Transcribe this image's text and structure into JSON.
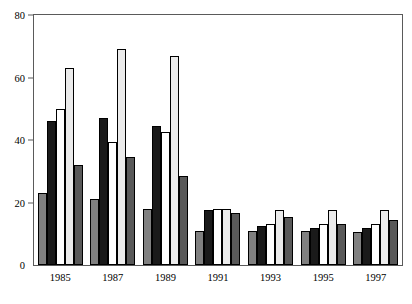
{
  "chart_data": {
    "type": "bar",
    "title": "",
    "subtitle": "",
    "xlabel": "",
    "ylabel": "",
    "categories": [
      "1985",
      "1987",
      "1989",
      "1991",
      "1993",
      "1995",
      "1997"
    ],
    "series": [
      {
        "name": "Bolivia",
        "color": "#808080",
        "values": [
          23,
          21,
          18,
          11,
          11,
          11,
          10.5
        ]
      },
      {
        "name": "Colombia",
        "color": "#1a1a1a",
        "values": [
          46,
          47,
          44.5,
          17.5,
          12.5,
          12,
          12
        ]
      },
      {
        "name": "Ecuador",
        "color": "#ffffff",
        "values": [
          50,
          39.5,
          42.5,
          18,
          13,
          13,
          13
        ]
      },
      {
        "name": "Peru",
        "color": "#ebebeb",
        "values": [
          63,
          69,
          67,
          18,
          17.5,
          17.5,
          17.5
        ]
      },
      {
        "name": "Venezuela",
        "color": "#595959",
        "values": [
          32,
          34.5,
          28.5,
          16.5,
          15.5,
          13,
          14.5
        ]
      }
    ],
    "ylim": [
      0,
      80
    ],
    "yticks": [
      0,
      20,
      40,
      60,
      80
    ],
    "ytick_labels": [
      "0",
      "20",
      "40",
      "60",
      "80"
    ],
    "grid": false,
    "legend_position": "top-center",
    "bar_border_color": "#000000",
    "frame_color": "#5a5a5a"
  },
  "legend": {
    "entries": [
      {
        "label": "Bolivia"
      },
      {
        "label": "Colombia"
      },
      {
        "label": "Ecuador"
      },
      {
        "label": "Peru"
      },
      {
        "label": "Venezuela"
      }
    ]
  }
}
